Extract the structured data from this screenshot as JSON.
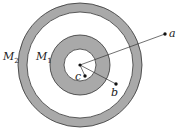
{
  "diagram": {
    "colors": {
      "shell_fill": "#a9a9a9",
      "stroke": "#333333",
      "background": "#ffffff"
    },
    "shells": [
      {
        "name": "M",
        "sub": "2",
        "label": "M2",
        "outer_r": 62,
        "inner_r": 53
      },
      {
        "name": "M",
        "sub": "1",
        "label": "M1",
        "outer_r": 30,
        "inner_r": 16
      }
    ],
    "center": {
      "x": 80,
      "y": 65
    },
    "points": [
      {
        "label": "a",
        "x": 165,
        "y": 34
      },
      {
        "label": "b",
        "x": 116,
        "y": 84
      },
      {
        "label": "c",
        "x": 85,
        "y": 76
      }
    ]
  }
}
